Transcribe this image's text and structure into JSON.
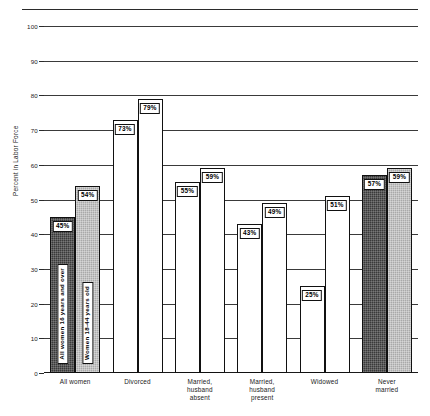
{
  "chart_data": {
    "type": "bar",
    "title": "",
    "subtitle": "",
    "xlabel": "",
    "ylabel": "Percent in Labor Force",
    "ylim": [
      0,
      100
    ],
    "yticks": [
      0,
      10,
      20,
      30,
      40,
      50,
      60,
      70,
      80,
      90,
      100
    ],
    "ytick_labels": [
      "0",
      "10",
      "20",
      "30",
      "40",
      "50",
      "60",
      "70",
      "80",
      "90",
      "100"
    ],
    "grid": true,
    "grid_axis": "y",
    "legend_position": "inside-first-group-bars",
    "categories": [
      "All women",
      "Divorced",
      "Married,\nhusband\nabsent",
      "Married,\nhusband\npresent",
      "Widowed",
      "Never\nmarried"
    ],
    "series": [
      {
        "name": "All women 16 years and over",
        "fill": "dark",
        "color": "#3a3a3a",
        "values": [
          45,
          73,
          55,
          43,
          25,
          57
        ],
        "value_labels": [
          "45%",
          "73%",
          "55%",
          "43%",
          "25%",
          "57%"
        ]
      },
      {
        "name": "Women 18-44 years old",
        "fill": "mid",
        "color": "#a9a9a9",
        "values": [
          54,
          79,
          59,
          49,
          51,
          59
        ],
        "value_labels": [
          "54%",
          "79%",
          "59%",
          "49%",
          "51%",
          "59%"
        ]
      }
    ],
    "bar_fill_by_group": [
      [
        "dark",
        "mid"
      ],
      [
        "light",
        "light"
      ],
      [
        "light",
        "light"
      ],
      [
        "light",
        "light"
      ],
      [
        "light",
        "light"
      ],
      [
        "dark",
        "mid"
      ]
    ],
    "legend_entries": [
      "All women 16 years and over",
      "Women 18-44 years old"
    ]
  }
}
